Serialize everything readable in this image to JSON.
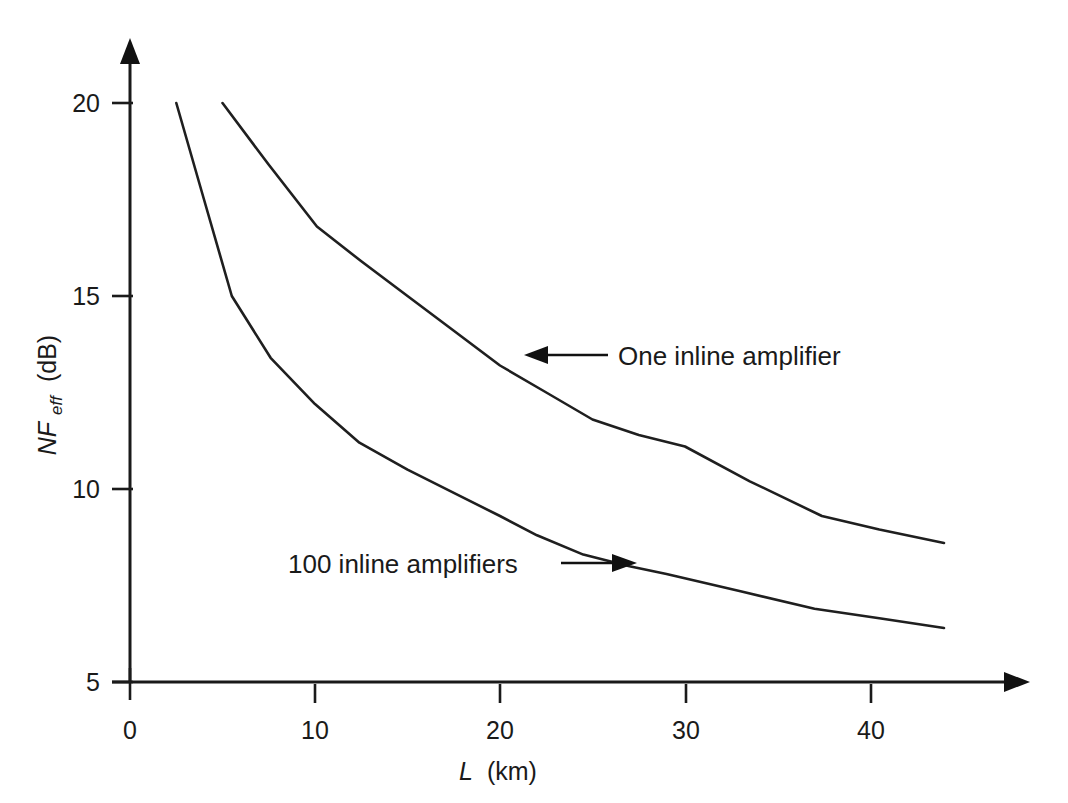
{
  "figure": {
    "background_color": "#ffffff",
    "line_color": "#1f1f1f",
    "text_color": "#1a1a1a"
  },
  "chart_data": {
    "type": "line",
    "title": "",
    "xlabel": "L (km)",
    "xlabel_symbol": "L",
    "xlabel_units": "(km)",
    "ylabel": "NF_eff (dB)",
    "ylabel_symbol": "NF",
    "ylabel_subscript": "eff",
    "ylabel_units": "(dB)",
    "xlim": [
      0,
      47
    ],
    "ylim": [
      5,
      21
    ],
    "xticks": [
      0,
      10,
      20,
      30,
      40
    ],
    "xtick_labels": [
      "0",
      "10",
      "20",
      "30",
      "40"
    ],
    "yticks": [
      5,
      10,
      15,
      20
    ],
    "ytick_labels": [
      "5",
      "10",
      "15",
      "20"
    ],
    "grid": false,
    "legend_position": "inline-annotations",
    "series": [
      {
        "name": "One inline amplifier",
        "label": "One inline amplifier",
        "x": [
          5.0,
          7.5,
          10.1,
          12.5,
          15.0,
          17.5,
          20.0,
          22.5,
          25.0,
          27.5,
          30.0,
          33.5,
          37.4,
          40.5,
          44.0
        ],
        "values": [
          20.0,
          18.4,
          16.8,
          15.9,
          15.0,
          14.1,
          13.2,
          12.5,
          11.8,
          11.4,
          11.1,
          10.2,
          9.3,
          8.95,
          8.6
        ]
      },
      {
        "name": "100 inline amplifiers",
        "label": "100 inline amplifiers",
        "x": [
          2.5,
          4.0,
          5.5,
          7.6,
          10.0,
          12.4,
          15.0,
          17.5,
          20.0,
          22.0,
          24.5,
          27.0,
          29.0,
          33.0,
          37.0,
          40.5,
          44.0
        ],
        "values": [
          20.0,
          17.5,
          15.0,
          13.4,
          12.2,
          11.2,
          10.5,
          9.9,
          9.3,
          8.8,
          8.3,
          8.0,
          7.8,
          7.35,
          6.9,
          6.65,
          6.4
        ]
      }
    ],
    "annotations": [
      {
        "text": "One inline amplifier",
        "arrow": "left-arrow",
        "x": 22.0,
        "y": 13.5
      },
      {
        "text": "100 inline amplifiers",
        "arrow": "right-arrow",
        "x": 10.5,
        "y": 8.0
      }
    ]
  }
}
